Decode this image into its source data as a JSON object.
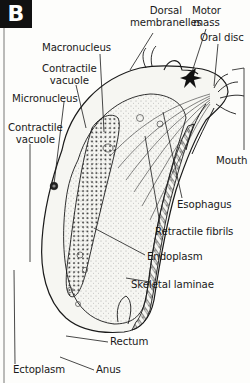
{
  "figure": {
    "panel_letter": "B",
    "colors": {
      "ink": "#1a1a1a",
      "background": "#fdfdfb",
      "badge_bg": "#111111",
      "badge_text": "#ffffff"
    }
  },
  "labels": {
    "dorsal_membranelles": [
      "Dorsal",
      "membranelles"
    ],
    "motor_mass": [
      "Motor",
      "mass"
    ],
    "oral_disc": "Oral disc",
    "macronucleus": "Macronucleus",
    "contractile_vacuole_top": [
      "Contractile",
      "vacuole"
    ],
    "micronucleus": "Micronucleus",
    "contractile_vacuole_left": [
      "Contractile",
      "vacuole"
    ],
    "mouth": "Mouth",
    "esophagus": "Esophagus",
    "retractile_fibrils": "Retractile fibrils",
    "endoplasm": "Endoplasm",
    "skeletal_laminae": "Skeletal laminae",
    "rectum": "Rectum",
    "ectoplasm": "Ectoplasm",
    "anus": "Anus"
  }
}
